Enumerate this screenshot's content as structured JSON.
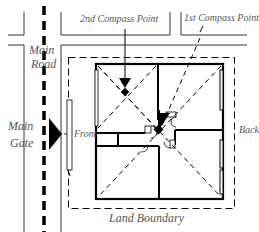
{
  "diagram": {
    "labels": {
      "second_compass_point": "2nd Compass Point",
      "first_compass_point": "1st Compass Point",
      "main_road_line1": "Main",
      "main_road_line2": "Road",
      "main_gate_line1": "Main",
      "main_gate_line2": "Gate",
      "front": "Front",
      "back": "Back",
      "land_boundary": "Land Boundary"
    },
    "icons": {
      "gate": "triangle-arrow-right",
      "compass_point": "arrow-down-with-cross",
      "center_point": "filled-square-marker"
    },
    "colors": {
      "line": "#000000",
      "text": "#555555",
      "background": "#ffffff"
    }
  }
}
